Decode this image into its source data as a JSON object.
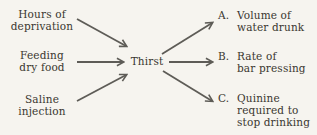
{
  "diagram": {
    "center_node": {
      "label": "Thirst"
    },
    "causes": [
      {
        "id": "hours-of-deprivation",
        "lines": [
          "Hours of",
          "deprivation"
        ]
      },
      {
        "id": "feeding-dry-food",
        "lines": [
          "Feeding",
          "dry food"
        ]
      },
      {
        "id": "saline-injection",
        "lines": [
          "Saline",
          "injection"
        ]
      }
    ],
    "effects": [
      {
        "id": "volume-of-water-drunk",
        "letter": "A.",
        "lines": [
          "Volume of",
          "water drunk"
        ]
      },
      {
        "id": "rate-of-bar-pressing",
        "letter": "B.",
        "lines": [
          "Rate of",
          "bar pressing"
        ]
      },
      {
        "id": "quinine-required-to-stop-drinking",
        "letter": "C.",
        "lines": [
          "Quinine",
          "required to",
          "stop drinking"
        ]
      }
    ],
    "edges": [
      {
        "from": "hours-of-deprivation",
        "to": "thirst"
      },
      {
        "from": "feeding-dry-food",
        "to": "thirst"
      },
      {
        "from": "saline-injection",
        "to": "thirst"
      },
      {
        "from": "thirst",
        "to": "volume-of-water-drunk"
      },
      {
        "from": "thirst",
        "to": "rate-of-bar-pressing"
      },
      {
        "from": "thirst",
        "to": "quinine-required-to-stop-drinking"
      }
    ],
    "colors": {
      "background": "#f6f4ef",
      "text": "#3a372f",
      "arrow": "#5e5c57"
    }
  }
}
